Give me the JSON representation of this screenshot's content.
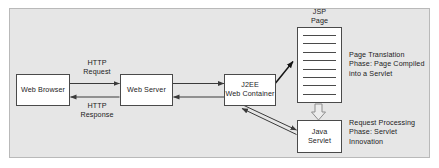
{
  "diagram": {
    "background_color": "#e6e6e6",
    "frame_border_color": "#b9b9b9",
    "node_border_color": "#4a4a4a",
    "node_fill_color": "#ffffff",
    "arrow_color": "#3a3a3a",
    "nodes": [
      {
        "id": "web-browser",
        "label": "Web Browser"
      },
      {
        "id": "web-server",
        "label": "Web Server"
      },
      {
        "id": "j2ee-line1",
        "label": "J2EE"
      },
      {
        "id": "j2ee-line2",
        "label": "Web Container"
      },
      {
        "id": "java-line1",
        "label": "Java"
      },
      {
        "id": "java-line2",
        "label": "Servlet"
      }
    ],
    "edge_labels": {
      "http_request_line1": "HTTP",
      "http_request_line2": "Request",
      "http_response_line1": "HTTP",
      "http_response_line2": "Response"
    },
    "jsp_document": {
      "caption_line1": "JSP",
      "caption_line2": "Page",
      "text_line_count": 8
    },
    "annotations": {
      "page_translation": {
        "line1": "Page Translation",
        "line2": "Phase: Page Compiled",
        "line3": "into a Servlet"
      },
      "request_processing": {
        "line1": "Request Processing",
        "line2": "Phase: Servlet",
        "line3": "Innovation"
      }
    }
  }
}
